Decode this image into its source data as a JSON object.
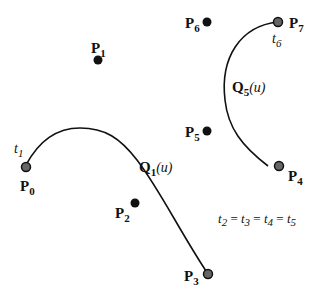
{
  "points": [
    {
      "id": "P0",
      "name": "P",
      "sub": "0",
      "kind": "endpoint"
    },
    {
      "id": "P1",
      "name": "P",
      "sub": "1",
      "kind": "control"
    },
    {
      "id": "P2",
      "name": "P",
      "sub": "2",
      "kind": "control"
    },
    {
      "id": "P3",
      "name": "P",
      "sub": "3",
      "kind": "endpoint"
    },
    {
      "id": "P4",
      "name": "P",
      "sub": "4",
      "kind": "endpoint"
    },
    {
      "id": "P5",
      "name": "P",
      "sub": "5",
      "kind": "control"
    },
    {
      "id": "P6",
      "name": "P",
      "sub": "6",
      "kind": "control"
    },
    {
      "id": "P7",
      "name": "P",
      "sub": "7",
      "kind": "endpoint"
    }
  ],
  "curves": [
    {
      "name": "Q",
      "sub": "1",
      "arg": "(u)"
    },
    {
      "name": "Q",
      "sub": "5",
      "arg": "(u)"
    }
  ],
  "knots": {
    "t1": {
      "name": "t",
      "sub": "1"
    },
    "t6": {
      "name": "t",
      "sub": "6"
    },
    "equality": {
      "parts": [
        {
          "name": "t",
          "sub": "2"
        },
        {
          "name": "t",
          "sub": "3"
        },
        {
          "name": "t",
          "sub": "4"
        },
        {
          "name": "t",
          "sub": "5"
        }
      ],
      "sep": " = "
    }
  },
  "colors": {
    "control": "#111111",
    "endpoint": "#666666",
    "curve": "#111111"
  }
}
